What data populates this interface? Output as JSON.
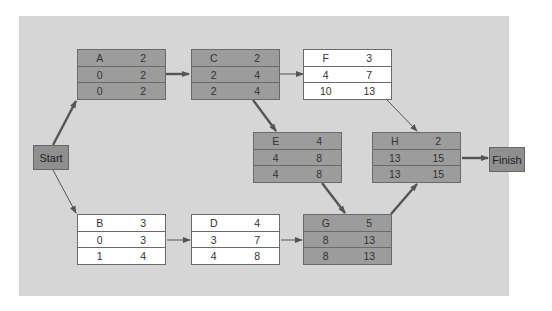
{
  "diagram": {
    "type": "activity-on-node network (critical path)",
    "start_label": "Start",
    "finish_label": "Finish",
    "legend_note": "Shaded nodes lie on the critical path",
    "colors": {
      "panel": "#d6d6d6",
      "critical_node": "#9c9c9c",
      "normal_node": "#ffffff",
      "border": "#6a6a6a",
      "arrow": "#555555"
    },
    "nodes": {
      "A": {
        "name": "A",
        "duration": "2",
        "es": "0",
        "ef": "2",
        "ls": "0",
        "lf": "2",
        "critical": true
      },
      "B": {
        "name": "B",
        "duration": "3",
        "es": "0",
        "ef": "3",
        "ls": "1",
        "lf": "4",
        "critical": false
      },
      "C": {
        "name": "C",
        "duration": "2",
        "es": "2",
        "ef": "4",
        "ls": "2",
        "lf": "4",
        "critical": true
      },
      "D": {
        "name": "D",
        "duration": "4",
        "es": "3",
        "ef": "7",
        "ls": "4",
        "lf": "8",
        "critical": false
      },
      "E": {
        "name": "E",
        "duration": "4",
        "es": "4",
        "ef": "8",
        "ls": "4",
        "lf": "8",
        "critical": true
      },
      "F": {
        "name": "F",
        "duration": "3",
        "es": "4",
        "ef": "7",
        "ls": "10",
        "lf": "13",
        "critical": false
      },
      "G": {
        "name": "G",
        "duration": "5",
        "es": "8",
        "ef": "13",
        "ls": "8",
        "lf": "13",
        "critical": true
      },
      "H": {
        "name": "H",
        "duration": "2",
        "es": "13",
        "ef": "15",
        "ls": "13",
        "lf": "15",
        "critical": true
      }
    },
    "edges": [
      {
        "from": "Start",
        "to": "A",
        "critical": true
      },
      {
        "from": "Start",
        "to": "B",
        "critical": false
      },
      {
        "from": "A",
        "to": "C",
        "critical": true
      },
      {
        "from": "C",
        "to": "F",
        "critical": false
      },
      {
        "from": "C",
        "to": "E",
        "critical": true
      },
      {
        "from": "B",
        "to": "D",
        "critical": false
      },
      {
        "from": "D",
        "to": "G",
        "critical": false
      },
      {
        "from": "E",
        "to": "G",
        "critical": true
      },
      {
        "from": "F",
        "to": "H",
        "critical": false
      },
      {
        "from": "G",
        "to": "H",
        "critical": true
      },
      {
        "from": "H",
        "to": "Finish",
        "critical": true
      }
    ]
  }
}
